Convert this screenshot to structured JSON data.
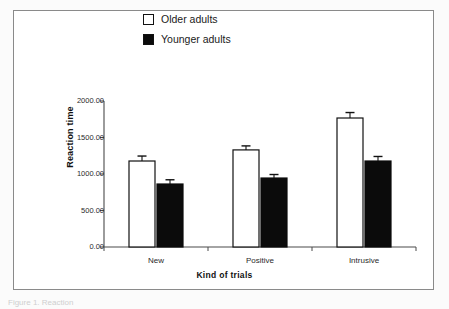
{
  "figure": {
    "caption_partial": "Figure 1. Reaction",
    "frame_color": "#8a8a8a",
    "background_color": "#ffffff"
  },
  "legend": {
    "position": "top-center",
    "items": [
      {
        "label": "Older adults",
        "swatch": "hollow-square",
        "color": "#ffffff"
      },
      {
        "label": "Younger adults",
        "swatch": "filled-square",
        "color": "#0b0b0b"
      }
    ]
  },
  "chart_data": {
    "type": "bar",
    "title": "",
    "xlabel": "Kind of trials",
    "ylabel": "Reaction time",
    "categories": [
      "New",
      "Positive",
      "Intrusive"
    ],
    "ylim": [
      0,
      2000
    ],
    "yticks": [
      0,
      500,
      1000,
      1500,
      2000
    ],
    "ytick_labels": [
      "0.00",
      "500.00",
      "1000.00",
      "1500.00",
      "2000.00"
    ],
    "grid": false,
    "legend_position": "top-center",
    "series": [
      {
        "name": "Older adults",
        "color": "#ffffff",
        "edge_color": "#111111",
        "values": [
          1178,
          1330,
          1767
        ],
        "errors": [
          68,
          55,
          75
        ]
      },
      {
        "name": "Younger adults",
        "color": "#0b0b0b",
        "edge_color": "#0b0b0b",
        "values": [
          863,
          945,
          1178
        ],
        "errors": [
          58,
          48,
          62
        ]
      }
    ]
  }
}
